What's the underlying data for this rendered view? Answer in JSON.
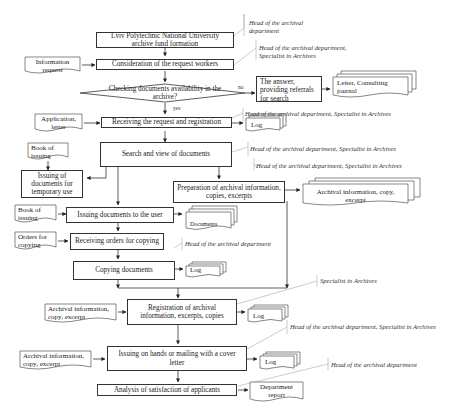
{
  "diagram": {
    "process": {
      "fund_formation": "Lviv Polytechnic National University archive fund formation",
      "consideration": "Consideration of the request workers",
      "checking": "Checking documents availability in the archive?",
      "answer": "The answer, providing referrals for search",
      "receiving_request": "Receiving the request and registration",
      "search": "Search and view of documents",
      "issuing_temporary": "Issuing of documents for temporary use",
      "preparation": "Preparation of archival information, copies, excerpts",
      "issuing_user": "Issuing documents to the user",
      "receiving_orders": "Receiving orders for copying",
      "copying": "Copying documents",
      "registration": "Registration of archival information, excerpts, copies",
      "issuing_hands": "Issuing on hands or mailing with a cover letter",
      "analysis": "Analysis of satisfaction of applicants"
    },
    "documents": {
      "information_request": "Information request",
      "letter_journal": "Letter, Consulting journal",
      "application_letter": "Application, letter",
      "log_1": "Log",
      "book_issuing_1": "Book of issuing",
      "archival_info_out": "Archival information, copy, excerpt",
      "book_issuing_2": "Book of issuing",
      "documents_out": "Documents",
      "orders_copying": "Orders for copying",
      "log_2": "Log",
      "archival_info_in_1": "Archival information, copy, excerpt",
      "log_3": "Log",
      "archival_info_in_2": "Archival information, copy, excerpt",
      "log_4": "Log",
      "department_report": "Department report"
    },
    "decision_labels": {
      "no": "no",
      "yes": "yes"
    },
    "responsible": {
      "r1": "Head of the archival department",
      "r2": "Head of the archival department, Specialist in Archives",
      "r3": "Head of the archival department, Specialist in Archives",
      "r4": "Head of the archival department, Specialist in Archives",
      "r5": "Head of the archival department, Specialist in Archives",
      "r6": "Head of the archival department",
      "r7": "Specialist in Archives",
      "r8": "Head of the archival department, Specialist in Archives",
      "r9": "Head of the archival department"
    },
    "colors": {
      "line": "#333333",
      "note_line": "#aaaaaa",
      "background": "#ffffff"
    }
  }
}
